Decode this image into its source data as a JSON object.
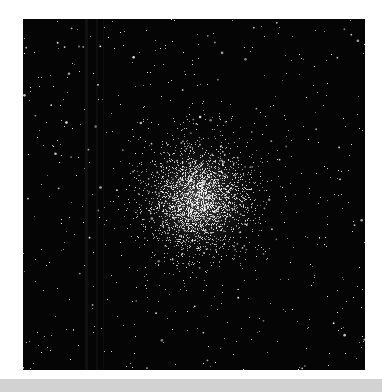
{
  "image": {
    "subject": "globular star cluster",
    "frame": {
      "x": 23,
      "y": 19,
      "width": 342,
      "height": 351
    },
    "background_color": "#050505",
    "page_color": "#ffffff",
    "bottom_strip_color": "#d2d2d2"
  },
  "render": {
    "seed": 1337,
    "cluster_center": {
      "x": 175,
      "y": 180
    },
    "cluster_core_radius": 22,
    "cluster_halo_radius": 75,
    "cluster_star_count": 2600,
    "field_star_count": 520,
    "streaks": [
      {
        "x": 62,
        "width": 3,
        "alpha": 0.05
      },
      {
        "x": 73,
        "width": 2,
        "alpha": 0.04
      },
      {
        "x": 80,
        "width": 1,
        "alpha": 0.035
      }
    ],
    "glow_color": "rgba(200,200,200,0.35)"
  }
}
